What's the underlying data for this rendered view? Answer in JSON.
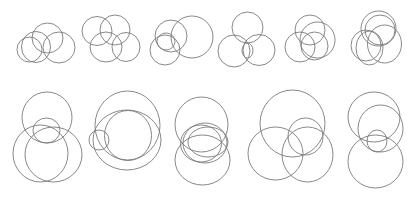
{
  "diagram": {
    "title": "",
    "stroke_color": "#7a7a7a",
    "background_color": "#ffffff",
    "rows": [
      {
        "name": "top-row",
        "panels": [
          {
            "name": "config-1",
            "circle_count": 4
          },
          {
            "name": "config-2",
            "circle_count": 4
          },
          {
            "name": "config-3",
            "circle_count": 4
          },
          {
            "name": "config-4",
            "circle_count": 4
          },
          {
            "name": "config-5",
            "circle_count": 4
          },
          {
            "name": "config-6",
            "circle_count": 5
          }
        ]
      },
      {
        "name": "bottom-row",
        "panels": [
          {
            "name": "config-7",
            "circle_count": 4
          },
          {
            "name": "config-8",
            "circle_count": 4
          },
          {
            "name": "config-9",
            "circle_count": 5
          },
          {
            "name": "config-10",
            "circle_count": 4
          },
          {
            "name": "config-11",
            "circle_count": 4
          }
        ]
      }
    ]
  }
}
